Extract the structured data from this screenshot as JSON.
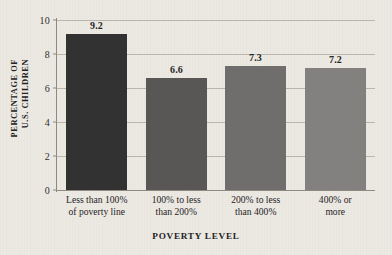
{
  "chart_data": {
    "type": "bar",
    "title": "",
    "subtitle": "",
    "xlabel": "POVERTY LEVEL",
    "ylabel": "PERCENTAGE OF U.S. CHILDREN",
    "ylabel_line1": "PERCENTAGE OF",
    "ylabel_line2": "U.S. CHILDREN",
    "categories": [
      "Less than 100% of poverty line",
      "100% to less than 200%",
      "200% to less than 400%",
      "400% or more"
    ],
    "category_lines": [
      [
        "Less than 100%",
        "of poverty line"
      ],
      [
        "100% to less",
        "than 200%"
      ],
      [
        "200% to less",
        "than 400%"
      ],
      [
        "400% or",
        "more"
      ]
    ],
    "values": [
      9.2,
      6.6,
      7.3,
      7.2
    ],
    "value_labels": [
      "9.2",
      "6.6",
      "7.3",
      "7.2"
    ],
    "bar_colors": [
      "#333232",
      "#585756",
      "#6f6e6c",
      "#828180"
    ],
    "ylim": [
      0,
      10
    ],
    "yticks": [
      0,
      2,
      4,
      6,
      8,
      10
    ],
    "ytick_labels": [
      "0",
      "2",
      "4",
      "6",
      "8",
      "10"
    ],
    "grid": true,
    "grid_axis": "y",
    "legend": false,
    "legend_position": "none",
    "background_color": "#edeae4",
    "axis_color": "#8e8a82",
    "gridline_color": "#b9b5ad",
    "text_color": "#24211d"
  }
}
